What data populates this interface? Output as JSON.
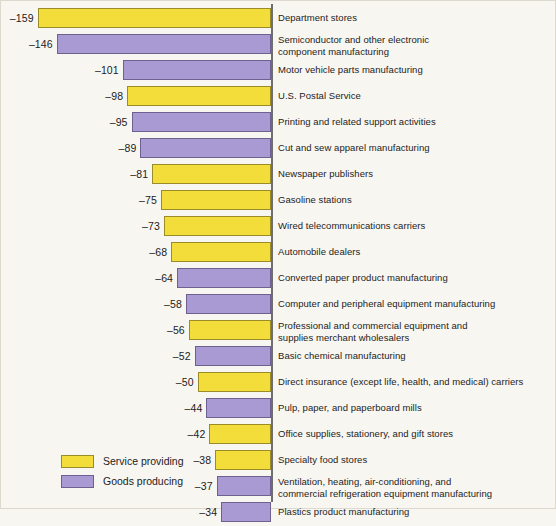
{
  "chart_data": {
    "type": "bar",
    "orientation": "horizontal",
    "title": "",
    "subtitle": "",
    "xlabel": "",
    "ylabel": "",
    "grid": false,
    "axis_zero_line": true,
    "legend_position": "bottom-left",
    "xlim": [
      -170,
      0
    ],
    "legend": [
      {
        "label": "Service providing",
        "color": "#f2dd3a",
        "key": "service"
      },
      {
        "label": "Goods producing",
        "color": "#a99ad4",
        "key": "goods"
      }
    ],
    "categories": [
      "Department stores",
      "Semiconductor and other electronic component manufacturing",
      "Motor vehicle parts manufacturing",
      "U.S. Postal Service",
      "Printing and related support activities",
      "Cut and sew apparel manufacturing",
      "Newspaper publishers",
      "Gasoline stations",
      "Wired telecommunications carriers",
      "Automobile dealers",
      "Converted paper product manufacturing",
      "Computer and peripheral equipment manufacturing",
      "Professional and commercial equipment and supplies merchant wholesalers",
      "Basic chemical manufacturing",
      "Direct insurance (except life, health, and medical) carriers",
      "Pulp, paper, and paperboard mills",
      "Office supplies, stationery, and gift stores",
      "Specialty food stores",
      "Ventilation, heating, air-conditioning, and commercial refrigeration equipment manufacturing",
      "Plastics product manufacturing"
    ],
    "values": [
      -159,
      -146,
      -101,
      -98,
      -95,
      -89,
      -81,
      -75,
      -73,
      -68,
      -64,
      -58,
      -56,
      -52,
      -50,
      -44,
      -42,
      -38,
      -37,
      -34
    ],
    "series_keys": [
      "service",
      "goods",
      "goods",
      "service",
      "goods",
      "goods",
      "service",
      "service",
      "service",
      "service",
      "goods",
      "goods",
      "service",
      "goods",
      "service",
      "goods",
      "service",
      "service",
      "goods",
      "goods"
    ]
  },
  "rows": [
    {
      "value_label": "–159",
      "category_line1": "Department stores",
      "category_line2": "",
      "series": "service"
    },
    {
      "value_label": "–146",
      "category_line1": "Semiconductor and other electronic",
      "category_line2": "component manufacturing",
      "series": "goods"
    },
    {
      "value_label": "–101",
      "category_line1": "Motor vehicle parts manufacturing",
      "category_line2": "",
      "series": "goods"
    },
    {
      "value_label": "–98",
      "category_line1": "U.S. Postal Service",
      "category_line2": "",
      "series": "service"
    },
    {
      "value_label": "–95",
      "category_line1": "Printing and related support activities",
      "category_line2": "",
      "series": "goods"
    },
    {
      "value_label": "–89",
      "category_line1": "Cut and sew apparel manufacturing",
      "category_line2": "",
      "series": "goods"
    },
    {
      "value_label": "–81",
      "category_line1": "Newspaper publishers",
      "category_line2": "",
      "series": "service"
    },
    {
      "value_label": "–75",
      "category_line1": "Gasoline stations",
      "category_line2": "",
      "series": "service"
    },
    {
      "value_label": "–73",
      "category_line1": "Wired telecommunications carriers",
      "category_line2": "",
      "series": "service"
    },
    {
      "value_label": "–68",
      "category_line1": "Automobile dealers",
      "category_line2": "",
      "series": "service"
    },
    {
      "value_label": "–64",
      "category_line1": "Converted paper product manufacturing",
      "category_line2": "",
      "series": "goods"
    },
    {
      "value_label": "–58",
      "category_line1": "Computer and peripheral equipment manufacturing",
      "category_line2": "",
      "series": "goods"
    },
    {
      "value_label": "–56",
      "category_line1": "Professional and commercial equipment and",
      "category_line2": "supplies merchant wholesalers",
      "series": "service"
    },
    {
      "value_label": "–52",
      "category_line1": "Basic chemical manufacturing",
      "category_line2": "",
      "series": "goods"
    },
    {
      "value_label": "–50",
      "category_line1": "Direct insurance (except life, health, and medical) carriers",
      "category_line2": "",
      "series": "service"
    },
    {
      "value_label": "–44",
      "category_line1": "Pulp, paper, and paperboard mills",
      "category_line2": "",
      "series": "goods"
    },
    {
      "value_label": "–42",
      "category_line1": "Office supplies, stationery, and gift stores",
      "category_line2": "",
      "series": "service"
    },
    {
      "value_label": "–38",
      "category_line1": "Specialty food stores",
      "category_line2": "",
      "series": "service"
    },
    {
      "value_label": "–37",
      "category_line1": "Ventilation, heating, air-conditioning, and",
      "category_line2": "commercial refrigeration equipment manufacturing",
      "series": "goods"
    },
    {
      "value_label": "–34",
      "category_line1": "Plastics product manufacturing",
      "category_line2": "",
      "series": "goods"
    }
  ],
  "legend": {
    "service_label": "Service providing",
    "goods_label": "Goods producing"
  },
  "colors": {
    "service_fill": "#f2dd3a",
    "service_stroke": "#9a8c28",
    "goods_fill": "#a99ad4",
    "goods_stroke": "#6d6192",
    "axis": "#6e6e6e",
    "background": "#f8f6f1",
    "text": "#1c1c1c"
  },
  "layout": {
    "axis_x": 271,
    "row_pitch": 26,
    "first_row_top": 8,
    "bar_height": 20,
    "px_per_unit": 1.468
  }
}
